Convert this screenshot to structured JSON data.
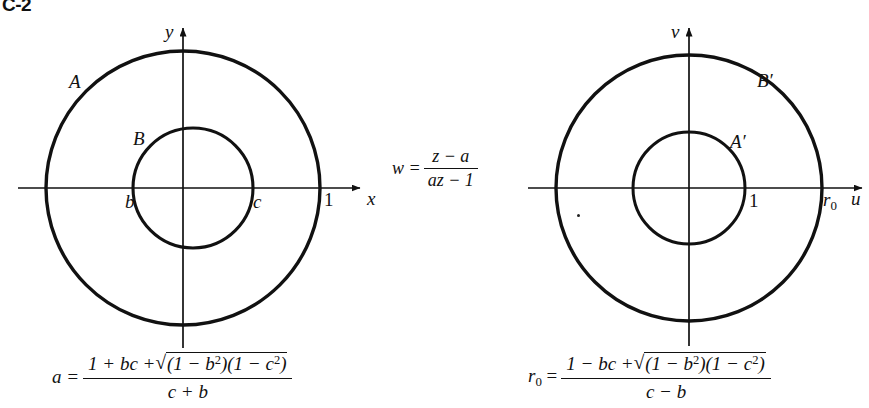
{
  "figure": {
    "tag": "C-2",
    "caption_missing": false
  },
  "left_plane": {
    "name": "z-plane",
    "axis_x_label": "x",
    "axis_y_label": "y",
    "outer_circle_label": "A",
    "inner_circle_label": "B",
    "tick_inner_left": "b",
    "tick_inner_right": "c",
    "tick_outer_right": "1",
    "geometry": {
      "center_x": 183,
      "center_y": 188,
      "outer_radius": 137,
      "inner_radius": 60,
      "inner_center_x": 193,
      "inner_center_y": 188
    }
  },
  "right_plane": {
    "name": "w-plane",
    "axis_x_label": "u",
    "axis_y_label": "v",
    "outer_circle_label": "B′",
    "inner_circle_label": "A′",
    "tick_inner_right": "1",
    "tick_outer_right": "r",
    "tick_outer_right_sub": "0",
    "geometry": {
      "center_x": 689,
      "center_y": 188,
      "outer_radius": 133,
      "inner_radius": 56
    }
  },
  "map_formula": {
    "lhs": "w =",
    "numerator": "z − a",
    "denominator": "az − 1"
  },
  "formula_a": {
    "lhs": "a =",
    "num_lead": "1 + bc +",
    "radicand_open": "(1 − b",
    "radicand_sup1": "2",
    "radicand_mid": ")(1 − c",
    "radicand_sup2": "2",
    "radicand_close": ")",
    "denominator": "c + b"
  },
  "formula_r0": {
    "lhs": "r",
    "lhs_sub": "0",
    "lhs_eq": "=",
    "num_lead": "1 − bc +",
    "radicand_open": "(1 − b",
    "radicand_sup1": "2",
    "radicand_mid": ")(1 − c",
    "radicand_sup2": "2",
    "radicand_close": ")",
    "denominator": "c − b"
  },
  "style": {
    "ink": "#111111",
    "paper": "#ffffff",
    "circle_stroke_width": 3.2,
    "axis_stroke_width": 1.6
  }
}
